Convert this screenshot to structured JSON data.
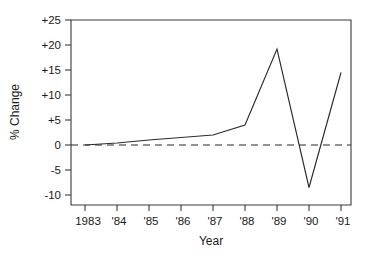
{
  "chart_data": {
    "type": "line",
    "title": "",
    "xlabel": "Year",
    "ylabel": "% Change",
    "x": [
      1983,
      1984,
      1985,
      1986,
      1987,
      1988,
      1989,
      1990,
      1991
    ],
    "x_tick_labels": [
      "1983",
      "'84",
      "'85",
      "'86",
      "'87",
      "'88",
      "'89",
      "'90",
      "'91"
    ],
    "values": [
      0.0,
      0.4,
      1.0,
      1.5,
      2.0,
      4.0,
      19.2,
      -8.5,
      14.5
    ],
    "y_tick_labels": [
      "+25",
      "+20",
      "+15",
      "+10",
      "+5",
      "0",
      "-5",
      "-10"
    ],
    "y_tick_values": [
      25,
      20,
      15,
      10,
      5,
      0,
      -5,
      -10
    ],
    "ylim": [
      -12.5,
      26.5
    ],
    "xlim": [
      1982.6,
      1991.3
    ],
    "grid": false,
    "legend": null,
    "reference_line": {
      "name": "zero-reference-line",
      "value": 0,
      "style": "dashed"
    },
    "series": [
      {
        "name": "percent-change",
        "values": [
          0.0,
          0.4,
          1.0,
          1.5,
          2.0,
          4.0,
          19.2,
          -8.5,
          14.5
        ]
      }
    ],
    "colors": {
      "line": "#2b2b2b",
      "axis": "#3a3a3a",
      "background": "#ffffff"
    }
  }
}
